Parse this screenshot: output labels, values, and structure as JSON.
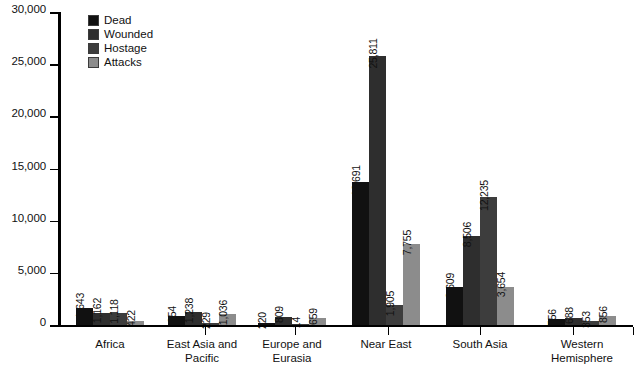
{
  "chart_data": {
    "type": "bar",
    "title": "",
    "xlabel": "",
    "ylabel": "",
    "ylim": [
      0,
      30000
    ],
    "ytick_labels": [
      "0",
      "5,000",
      "10,000",
      "15,000",
      "20,000",
      "25,000",
      "30,000"
    ],
    "ytick_values": [
      0,
      5000,
      10000,
      15000,
      20000,
      25000,
      30000
    ],
    "grid": false,
    "legend_position": "top-left",
    "categories": [
      "Africa",
      "East Asia and\nPacific",
      "Europe and\nEurasia",
      "Near East",
      "South Asia",
      "Western\nHemisphere"
    ],
    "series": [
      {
        "name": "Dead",
        "color": "#111111",
        "values": [
          1643,
          854,
          220,
          13691,
          3609,
          556
        ],
        "labels": [
          "1,643",
          "854",
          "220",
          "13,691",
          "3,609",
          "556"
        ]
      },
      {
        "name": "Wounded",
        "color": "#2e2e2e",
        "values": [
          1162,
          1238,
          809,
          25811,
          8506,
          688
        ],
        "labels": [
          "1,162",
          "1,238",
          "809",
          "25,811",
          "8,506",
          "688"
        ]
      },
      {
        "name": "Hostage",
        "color": "#3d3d3d",
        "values": [
          1118,
          229,
          14,
          1905,
          12235,
          353
        ],
        "labels": [
          "1,118",
          "229",
          "14",
          "1,905",
          "12,235",
          "353"
        ]
      },
      {
        "name": "Attacks",
        "color": "#8c8c8c",
        "values": [
          422,
          1036,
          659,
          7755,
          3654,
          856
        ],
        "labels": [
          "422",
          "1,036",
          "659",
          "7,755",
          "3,654",
          "856"
        ]
      }
    ]
  },
  "legend": {
    "items": [
      {
        "label": "Dead",
        "color": "#111111"
      },
      {
        "label": "Wounded",
        "color": "#2e2e2e"
      },
      {
        "label": "Hostage",
        "color": "#3d3d3d"
      },
      {
        "label": "Attacks",
        "color": "#8c8c8c"
      }
    ]
  }
}
